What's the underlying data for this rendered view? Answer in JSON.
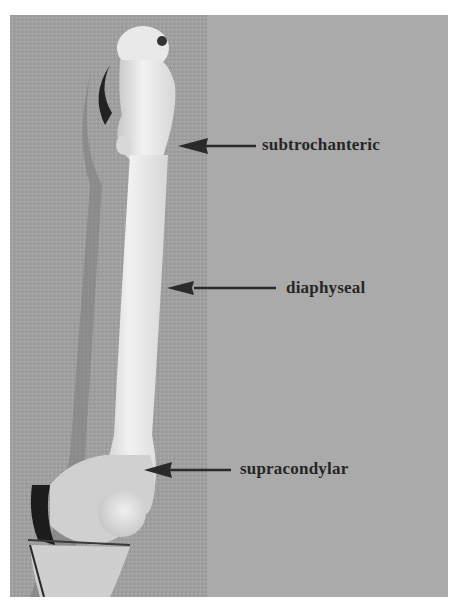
{
  "figure": {
    "colors": {
      "left_background": "#9c9c9c",
      "right_background": "#aaaaaa",
      "bone": "#e6e6e6",
      "arrow": "#2a2a2a",
      "label_text": "#262626"
    },
    "labels": [
      {
        "text": "subtrochanteric"
      },
      {
        "text": "diaphyseal"
      },
      {
        "text": "supracondylar"
      }
    ]
  }
}
